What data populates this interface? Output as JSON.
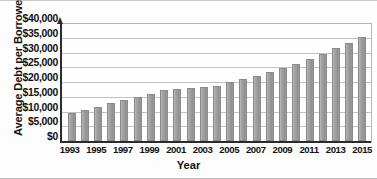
{
  "chart_data": {
    "type": "bar",
    "title": "",
    "xlabel": "Year",
    "ylabel": "Average Debt per Borrower",
    "ylim": [
      0,
      40000
    ],
    "grid": true,
    "legend": "none",
    "ytick_labels": [
      "$40,000",
      "$35,000",
      "$30,000",
      "$25,000",
      "$20,000",
      "$15,000",
      "$10,000",
      "$5,000",
      "$0"
    ],
    "ytick_values": [
      40000,
      35000,
      30000,
      25000,
      20000,
      15000,
      10000,
      5000,
      0
    ],
    "categories": [
      1993,
      1994,
      1995,
      1996,
      1997,
      1998,
      1999,
      2000,
      2001,
      2002,
      2003,
      2004,
      2005,
      2006,
      2007,
      2008,
      2009,
      2010,
      2011,
      2012,
      2013,
      2014,
      2015
    ],
    "xtick_labels": [
      "1993",
      "",
      "1995",
      "",
      "1997",
      "",
      "1999",
      "",
      "2001",
      "",
      "2003",
      "",
      "2005",
      "",
      "2007",
      "",
      "2009",
      "",
      "2011",
      "",
      "2013",
      "",
      "2015"
    ],
    "values": [
      9400,
      10400,
      11700,
      12900,
      13800,
      14900,
      16100,
      17300,
      17700,
      17900,
      18300,
      18800,
      20100,
      21000,
      22000,
      23400,
      24900,
      26200,
      27900,
      29500,
      31400,
      33100,
      35400
    ],
    "bar_color": "#9e9e9e",
    "axis_color": "#2c2c2c",
    "grid_color": "#c2c2c2"
  }
}
